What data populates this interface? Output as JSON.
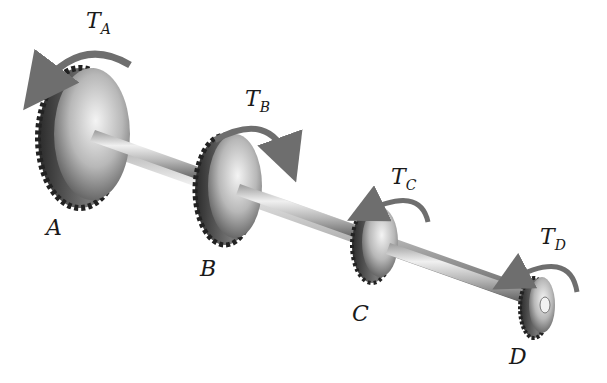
{
  "diagram": {
    "type": "shaft with four gears under applied torques",
    "gears": [
      {
        "id": "A",
        "label": "A",
        "torque_label": "T",
        "torque_sub": "A",
        "torque_direction": "counterclockwise"
      },
      {
        "id": "B",
        "label": "B",
        "torque_label": "T",
        "torque_sub": "B",
        "torque_direction": "clockwise"
      },
      {
        "id": "C",
        "label": "C",
        "torque_label": "T",
        "torque_sub": "C",
        "torque_direction": "counterclockwise"
      },
      {
        "id": "D",
        "label": "D",
        "torque_label": "T",
        "torque_sub": "D",
        "torque_direction": "counterclockwise"
      }
    ],
    "colors": {
      "arrow": "#6e6e6e",
      "metal_light": "#e6e6e6",
      "metal_dark": "#3a3a3a",
      "text": "#1a1a1a"
    }
  }
}
